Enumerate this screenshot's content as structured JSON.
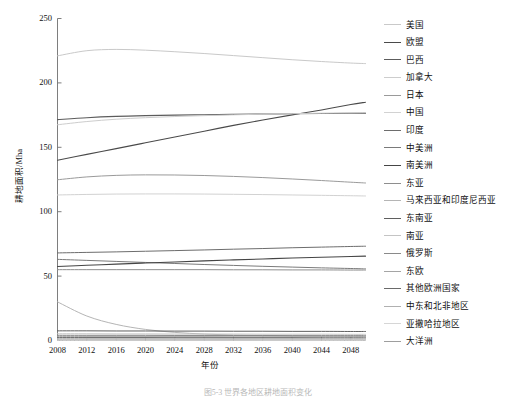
{
  "figure": {
    "caption": "图5-3  世界各地区耕地面积变化"
  },
  "chart_data": {
    "type": "line",
    "title": "",
    "xlabel": "年份",
    "ylabel": "耕地面积/Mha",
    "xlim": [
      2008,
      2050
    ],
    "ylim": [
      0,
      250
    ],
    "grid": false,
    "legend_position": "right",
    "xticks": [
      2008,
      2012,
      2016,
      2020,
      2024,
      2028,
      2032,
      2036,
      2040,
      2044,
      2048
    ],
    "xtick_labels": [
      "2008",
      "2012",
      "2016",
      "2020",
      "2024",
      "2028",
      "2032",
      "2036",
      "2040",
      "2044",
      "2048"
    ],
    "yticks": [
      0,
      50,
      100,
      150,
      200,
      250
    ],
    "ytick_labels": [
      "0",
      "50",
      "100",
      "150",
      "200",
      "250"
    ],
    "x": [
      2008,
      2012,
      2016,
      2020,
      2024,
      2028,
      2032,
      2036,
      2040,
      2044,
      2048,
      2050
    ],
    "series": [
      {
        "name": "美国",
        "color": "#c9c9c9",
        "width": 1.0,
        "values": [
          221.0,
          225.0,
          226.0,
          225.4,
          224.2,
          222.8,
          221.2,
          219.6,
          218.0,
          216.6,
          215.4,
          215.0
        ]
      },
      {
        "name": "欧盟",
        "color": "#4a4a4a",
        "width": 1.1,
        "values": [
          140.0,
          144.5,
          149.0,
          153.5,
          158.0,
          162.5,
          167.0,
          171.2,
          175.2,
          179.0,
          183.2,
          185.0
        ]
      },
      {
        "name": "巴西",
        "color": "#5c5c5c",
        "width": 1.1,
        "values": [
          171.5,
          173.0,
          174.0,
          174.6,
          175.0,
          175.3,
          175.6,
          175.8,
          176.0,
          176.2,
          176.4,
          176.5
        ]
      },
      {
        "name": "加拿大",
        "color": "#cdcdcd",
        "width": 1.0,
        "values": [
          167.5,
          170.0,
          171.8,
          173.0,
          173.9,
          174.6,
          175.2,
          175.7,
          176.1,
          176.5,
          176.8,
          177.0
        ]
      },
      {
        "name": "日本",
        "color": "#9a9a9a",
        "width": 1.0,
        "values": [
          124.8,
          127.0,
          128.2,
          128.6,
          128.5,
          128.1,
          127.4,
          126.5,
          125.4,
          124.2,
          122.9,
          122.3
        ]
      },
      {
        "name": "中国",
        "color": "#d2d2d2",
        "width": 1.0,
        "values": [
          113.0,
          113.4,
          113.7,
          113.8,
          113.8,
          113.7,
          113.5,
          113.3,
          113.0,
          112.7,
          112.4,
          112.2
        ]
      },
      {
        "name": "印度",
        "color": "#6d6d6d",
        "width": 1.0,
        "values": [
          68.0,
          68.4,
          68.8,
          69.3,
          69.8,
          70.3,
          70.9,
          71.4,
          72.0,
          72.5,
          73.0,
          73.2
        ]
      },
      {
        "name": "中美洲",
        "color": "#7a7a7a",
        "width": 1.0,
        "values": [
          63.0,
          62.2,
          61.4,
          60.6,
          59.8,
          59.0,
          58.3,
          57.6,
          57.0,
          56.4,
          55.9,
          55.6
        ]
      },
      {
        "name": "南美洲",
        "color": "#454545",
        "width": 1.1,
        "values": [
          57.5,
          58.4,
          59.3,
          60.2,
          61.0,
          61.8,
          62.6,
          63.3,
          64.0,
          64.6,
          65.2,
          65.5
        ]
      },
      {
        "name": "东亚",
        "color": "#8e8e8e",
        "width": 1.0,
        "values": [
          55.0,
          55.0,
          55.0,
          55.0,
          55.0,
          55.0,
          54.9,
          54.9,
          54.8,
          54.8,
          54.7,
          54.7
        ]
      },
      {
        "name": "马来西亚和印度尼西亚",
        "color": "#b5b5b5",
        "width": 1.0,
        "values": [
          30.0,
          19.0,
          12.5,
          8.6,
          6.3,
          5.0,
          4.2,
          3.8,
          3.5,
          3.3,
          3.2,
          3.1
        ]
      },
      {
        "name": "东南亚",
        "color": "#5f5f5f",
        "width": 1.0,
        "values": [
          7.5,
          7.5,
          7.4,
          7.4,
          7.3,
          7.3,
          7.2,
          7.2,
          7.1,
          7.1,
          7.0,
          7.0
        ]
      },
      {
        "name": "南亚",
        "color": "#c4c4c4",
        "width": 1.0,
        "values": [
          5.2,
          5.2,
          5.1,
          5.1,
          5.0,
          5.0,
          5.0,
          4.9,
          4.9,
          4.9,
          4.8,
          4.8
        ]
      },
      {
        "name": "俄罗斯",
        "color": "#8a8a8a",
        "width": 1.0,
        "values": [
          4.0,
          4.0,
          4.0,
          4.0,
          3.9,
          3.9,
          3.9,
          3.9,
          3.8,
          3.8,
          3.8,
          3.8
        ]
      },
      {
        "name": "东欧",
        "color": "#a5a5a5",
        "width": 1.0,
        "values": [
          3.0,
          3.0,
          3.0,
          3.0,
          3.0,
          3.0,
          2.9,
          2.9,
          2.9,
          2.9,
          2.9,
          2.9
        ]
      },
      {
        "name": "其他欧洲国家",
        "color": "#6a6a6a",
        "width": 1.0,
        "values": [
          2.3,
          2.3,
          2.3,
          2.3,
          2.2,
          2.2,
          2.2,
          2.2,
          2.2,
          2.1,
          2.1,
          2.1
        ]
      },
      {
        "name": "中东和北非地区",
        "color": "#b0b0b0",
        "width": 1.0,
        "values": [
          1.6,
          1.6,
          1.6,
          1.6,
          1.6,
          1.5,
          1.5,
          1.5,
          1.5,
          1.5,
          1.5,
          1.5
        ]
      },
      {
        "name": "亚撒哈拉地区",
        "color": "#d6d6d6",
        "width": 1.0,
        "values": [
          1.0,
          1.0,
          1.0,
          1.0,
          1.0,
          1.0,
          0.9,
          0.9,
          0.9,
          0.9,
          0.9,
          0.9
        ]
      },
      {
        "name": "大洋洲",
        "color": "#9e9e9e",
        "width": 1.0,
        "values": [
          0.5,
          0.5,
          0.5,
          0.5,
          0.5,
          0.5,
          0.5,
          0.4,
          0.4,
          0.4,
          0.4,
          0.4
        ]
      },
      {
        "name": "其他",
        "color": "#e0e0e0",
        "width": 1.0,
        "values": [
          0.2,
          0.2,
          0.2,
          0.2,
          0.2,
          0.2,
          0.2,
          0.2,
          0.2,
          0.2,
          0.2,
          0.2
        ]
      }
    ]
  },
  "legend": {
    "items": [
      "美国",
      "欧盟",
      "巴西",
      "加拿大",
      "日本",
      "中国",
      "印度",
      "中美洲",
      "南美洲",
      "东亚",
      "马来西亚和印度尼西亚",
      "东南亚",
      "南亚",
      "俄罗斯",
      "东欧",
      "其他欧洲国家",
      "中东和北非地区",
      "亚撒哈拉地区",
      "大洋洲"
    ]
  }
}
